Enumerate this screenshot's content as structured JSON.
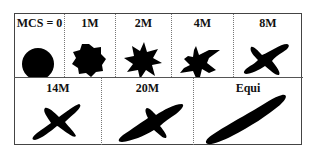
{
  "figure": {
    "top_row": [
      {
        "label": "MCS = 0",
        "shape": "circle"
      },
      {
        "label": "1M",
        "shape": "rounded-star-7"
      },
      {
        "label": "2M",
        "shape": "star-7"
      },
      {
        "label": "4M",
        "shape": "star-6-spiky"
      },
      {
        "label": "8M",
        "shape": "four-arm-x"
      }
    ],
    "bottom_row": [
      {
        "label": "14M",
        "shape": "four-arm-x-thin"
      },
      {
        "label": "20M",
        "shape": "elongated-with-branch"
      },
      {
        "label": "Equi",
        "shape": "elongated-rod"
      }
    ],
    "colors": {
      "shape_fill": "#000000",
      "border": "#444444",
      "background": "#ffffff"
    }
  }
}
